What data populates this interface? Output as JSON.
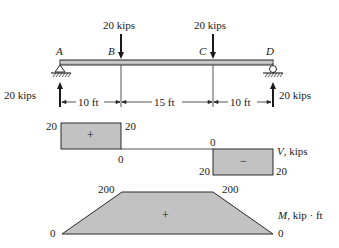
{
  "beam": {
    "points": [
      {
        "name": "A",
        "x_ft": 0
      },
      {
        "name": "B",
        "x_ft": 10
      },
      {
        "name": "C",
        "x_ft": 25
      },
      {
        "name": "D",
        "x_ft": 35
      }
    ],
    "loads": [
      {
        "point": "B",
        "label": "20 kips",
        "direction": "down"
      },
      {
        "point": "C",
        "label": "20 kips",
        "direction": "down"
      }
    ],
    "reactions": [
      {
        "point": "A",
        "label": "20 kips",
        "direction": "up",
        "support": "pin"
      },
      {
        "point": "D",
        "label": "20 kips",
        "direction": "up",
        "support": "roller"
      }
    ],
    "spans": [
      {
        "label": "10 ft"
      },
      {
        "label": "15 ft"
      },
      {
        "label": "10 ft"
      }
    ]
  },
  "shear_diagram": {
    "axis_label_var": "V",
    "axis_label_unit": ", kips",
    "labels": {
      "a_left": "20",
      "b_top": "20",
      "b_bottom": "0",
      "c_top": "0",
      "c_bottom_left": "20",
      "d_bottom": "20"
    },
    "positive_sign": "+",
    "negative_sign": "−"
  },
  "moment_diagram": {
    "axis_label_var": "M",
    "axis_label_unit": ", kip · ft",
    "labels": {
      "a": "0",
      "b": "200",
      "c": "200",
      "d": "0"
    },
    "positive_sign": "+"
  },
  "colors": {
    "fill": "#c2c2c2",
    "stroke": "#2a2a2a"
  }
}
